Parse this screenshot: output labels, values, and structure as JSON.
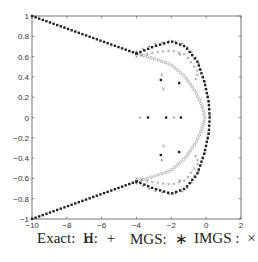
{
  "chart_data": {
    "type": "scatter",
    "title": "",
    "xlabel": "",
    "ylabel": "",
    "xlim": [
      -10,
      2
    ],
    "ylim": [
      -1,
      1
    ],
    "grid": false,
    "xticks": [
      -10,
      -8,
      -6,
      -4,
      -2,
      0,
      2
    ],
    "yticks": [
      -1,
      -0.8,
      -0.6,
      -0.4,
      -0.2,
      0,
      0.2,
      0.4,
      0.6,
      0.8,
      1
    ],
    "xtick_labels": [
      "−10",
      "−8",
      "−6",
      "−4",
      "−2",
      "0",
      "2"
    ],
    "ytick_labels": [
      "−1",
      "−0.8",
      "−0.6",
      "−0.4",
      "−0.2",
      "0",
      "0.2",
      "0.4",
      "0.6",
      "0.8",
      "1"
    ],
    "legend_placement": "bottom",
    "legend": [
      {
        "label": "Exact:",
        "marker": "o",
        "marker_text": "o"
      },
      {
        "label": "H:",
        "marker": "+",
        "marker_text": "+"
      },
      {
        "label": "MGS:",
        "marker": "*",
        "marker_text": "∗"
      },
      {
        "label": "IMGS :",
        "marker": "x",
        "marker_text": "×"
      }
    ],
    "series": [
      {
        "name": "Exact",
        "marker": "o",
        "description": "Eigenvalues along two straight branches from (-10,±1) to about (-4,±0.63), then a rounded arc closing at (0,0)",
        "branches": [
          {
            "from": [
              -10,
              1
            ],
            "to": [
              -4,
              0.63
            ],
            "count": 30
          },
          {
            "arc_points": [
              [
                -4,
                0.63
              ],
              [
                -3,
                0.58
              ],
              [
                -2,
                0.52
              ],
              [
                -1.2,
                0.4
              ],
              [
                -0.6,
                0.25
              ],
              [
                -0.25,
                0.12
              ],
              [
                -0.07,
                0
              ]
            ],
            "count": 28
          }
        ],
        "symmetric_about_x_axis": true
      },
      {
        "name": "H",
        "marker": "+",
        "points": [
          [
            -3.8,
            0
          ],
          [
            -1.85,
            0
          ],
          [
            -2.55,
            0.42
          ],
          [
            -0.6,
            0.38
          ],
          [
            -2.55,
            -0.42
          ],
          [
            -0.6,
            -0.38
          ],
          [
            -1.5,
            0.62
          ],
          [
            -1.5,
            -0.62
          ]
        ],
        "description": "Follows the outer arc (near the MGS points) plus a few scattered interior points",
        "outer_arc": [
          [
            -4,
            0.63
          ],
          [
            -3,
            0.7
          ],
          [
            -2,
            0.74
          ],
          [
            -1.2,
            0.7
          ],
          [
            -0.5,
            0.55
          ],
          [
            -0.1,
            0.35
          ],
          [
            0.15,
            0.15
          ],
          [
            0.2,
            0
          ]
        ]
      },
      {
        "name": "MGS",
        "marker": "*",
        "points": [
          [
            -3.34,
            0
          ],
          [
            -2.3,
            0
          ],
          [
            -1.45,
            0
          ],
          [
            -2.6,
            0.37
          ],
          [
            -1.55,
            0.34
          ],
          [
            -2.6,
            -0.37
          ],
          [
            -1.55,
            -0.34
          ]
        ],
        "description": "Dense points along straight branches and the outer bulging arc reaching x≈0.2 at y=0",
        "outer_arc": [
          [
            -4,
            0.63
          ],
          [
            -3,
            0.7
          ],
          [
            -2,
            0.75
          ],
          [
            -1.2,
            0.7
          ],
          [
            -0.5,
            0.55
          ],
          [
            -0.1,
            0.35
          ],
          [
            0.15,
            0.15
          ],
          [
            0.2,
            0
          ]
        ]
      },
      {
        "name": "IMGS",
        "marker": "x",
        "points": [
          [
            -2.45,
            0.28
          ],
          [
            -0.5,
            0.42
          ],
          [
            -2.45,
            -0.28
          ],
          [
            -0.5,
            -0.42
          ]
        ],
        "description": "Mostly coincident with the outer arc; a few scattered interior points",
        "outer_arc": [
          [
            -4,
            0.64
          ],
          [
            -3,
            0.68
          ],
          [
            -2,
            0.7
          ],
          [
            -1.2,
            0.66
          ],
          [
            -0.5,
            0.5
          ]
        ]
      }
    ]
  }
}
